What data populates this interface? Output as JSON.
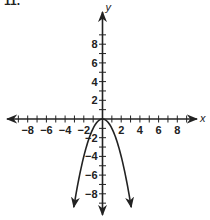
{
  "problem_number": "11.",
  "chart_data": {
    "type": "line",
    "title": "",
    "xlabel": "x",
    "ylabel": "y",
    "xlim": [
      -9.5,
      9.5
    ],
    "ylim": [
      -10,
      10
    ],
    "grid": false,
    "x_ticks": [
      -8,
      -6,
      -4,
      -2,
      2,
      4,
      6,
      8
    ],
    "y_ticks": [
      8,
      6,
      4,
      2,
      -2,
      -4,
      -6,
      -8
    ],
    "series": [
      {
        "name": "parabola",
        "equation": "y = -x^2",
        "vertex": [
          0,
          0
        ],
        "opens": "down",
        "x": [
          -3,
          -2,
          -1,
          0,
          1,
          2,
          3
        ],
        "y": [
          -9,
          -4,
          -1,
          0,
          -1,
          -4,
          -9
        ],
        "color": "#222222"
      }
    ],
    "origin_label": "0"
  },
  "colors": {
    "ink": "#222222",
    "background": "#ffffff"
  }
}
